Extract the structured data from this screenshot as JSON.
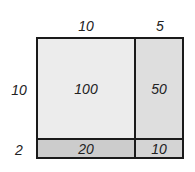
{
  "diagram": {
    "type": "area-model-multiplication",
    "top_labels": [
      "10",
      "5"
    ],
    "side_labels": [
      "10",
      "2"
    ],
    "cells": [
      [
        "100",
        "50"
      ],
      [
        "20",
        "10"
      ]
    ],
    "colors": {
      "border": "#1a1a1a",
      "cell_top_left": "#ececec",
      "cell_top_right": "#dedede",
      "cell_bottom_left": "#cccccc",
      "cell_bottom_right": "#d4d4d4"
    }
  }
}
